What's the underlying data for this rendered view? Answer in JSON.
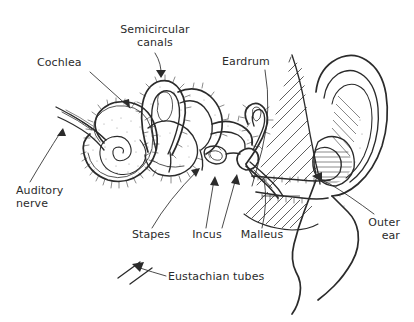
{
  "figure": {
    "background_color": "#ffffff",
    "ink_color": "#2b2b2b",
    "width": 414,
    "height": 322
  },
  "labels": {
    "cochlea": "Cochlea",
    "semicircular_canals_line1": "Semicircular",
    "semicircular_canals_line2": "canals",
    "eardrum": "Eardrum",
    "auditory_nerve_line1": "Auditory",
    "auditory_nerve_line2": "nerve",
    "stapes": "Stapes",
    "incus": "Incus",
    "malleus": "Malleus",
    "eustachian_tubes": "Eustachian tubes",
    "outer_ear_line1": "Outer",
    "outer_ear_line2": "ear"
  }
}
